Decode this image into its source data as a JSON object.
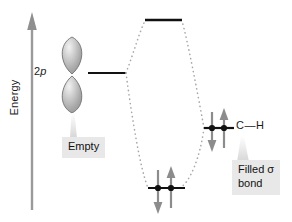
{
  "diagram": {
    "type": "molecular-orbital-energy-diagram",
    "axis": {
      "label": "Energy",
      "direction": "up",
      "arrow": "up-arrow-icon"
    },
    "colors": {
      "line": "#111111",
      "dotted": "#a8a8a8",
      "arrow_gray": "#8c8c8c",
      "axis_gray": "#9a9a9a",
      "orbital_fill": "#b3b3b3",
      "orbital_outline": "#6e6e6e",
      "callout_bg": "#e8e8e8",
      "background": "#ffffff"
    },
    "left_fragment": {
      "orbital_label": "2p",
      "orbital_label_plain": "2p",
      "orbital_italic_part": "p",
      "orbital_icon": "p-orbital-dumbbell-icon",
      "electron_count": 0,
      "callout": "Empty",
      "energy_level_y": 73
    },
    "right_fragment": {
      "label": "C—H",
      "atom_left": "C",
      "bond_dash": "—",
      "atom_right": "H",
      "electron_count": 2,
      "spins": [
        "down",
        "up"
      ],
      "callout": "Filled σ\nbond",
      "callout_line1": "Filled σ",
      "callout_line2": "bond",
      "energy_level_y": 128
    },
    "molecular_orbitals": [
      {
        "name": "antibonding",
        "label": "",
        "electron_count": 0,
        "spins": [],
        "energy_level_y": 20
      },
      {
        "name": "bonding",
        "label": "",
        "electron_count": 2,
        "spins": [
          "down",
          "up"
        ],
        "energy_level_y": 188
      }
    ],
    "correlation_lines": {
      "style": "dotted",
      "count": 4
    }
  }
}
